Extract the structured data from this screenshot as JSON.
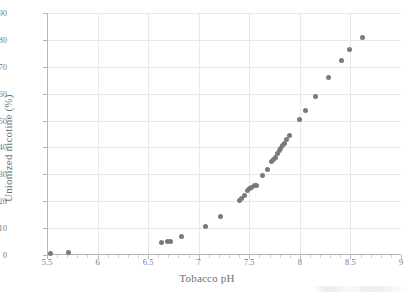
{
  "chart_data": {
    "type": "scatter",
    "title": "",
    "xlabel": "Tobacco pH",
    "ylabel": "Unionized nicotine (%)",
    "xlim": [
      5.5,
      9
    ],
    "ylim": [
      0,
      90
    ],
    "xticks": [
      "5.5",
      "6",
      "6.5",
      "7",
      "7.5",
      "8",
      "8.5",
      "9"
    ],
    "xtick_values": [
      5.5,
      6,
      6.5,
      7,
      7.5,
      8,
      8.5,
      9
    ],
    "yticks": [
      "0",
      "10",
      "20",
      "30",
      "40",
      "50",
      "60",
      "70",
      "80",
      "90"
    ],
    "ytick_values": [
      0,
      10,
      20,
      30,
      40,
      50,
      60,
      70,
      80,
      90
    ],
    "grid": true,
    "legend": false,
    "marker_color": "#7a7a7e",
    "gridline_color": "#e9e9ec",
    "axis_color": "#b6b6bb",
    "series": [
      {
        "name": "Unionized nicotine vs tobacco pH",
        "points": [
          [
            5.53,
            0.5
          ],
          [
            5.71,
            0.8
          ],
          [
            6.63,
            4.6
          ],
          [
            6.69,
            5.0
          ],
          [
            6.72,
            5.2
          ],
          [
            6.83,
            7.0
          ],
          [
            7.07,
            10.7
          ],
          [
            7.22,
            14.2
          ],
          [
            7.4,
            20.3
          ],
          [
            7.42,
            21.0
          ],
          [
            7.45,
            22.0
          ],
          [
            7.48,
            24.0
          ],
          [
            7.5,
            24.6
          ],
          [
            7.52,
            25.1
          ],
          [
            7.55,
            25.9
          ],
          [
            7.57,
            26.0
          ],
          [
            7.63,
            29.5
          ],
          [
            7.68,
            31.8
          ],
          [
            7.72,
            34.9
          ],
          [
            7.74,
            35.6
          ],
          [
            7.76,
            36.3
          ],
          [
            7.78,
            37.6
          ],
          [
            7.8,
            38.9
          ],
          [
            7.81,
            39.6
          ],
          [
            7.83,
            40.8
          ],
          [
            7.85,
            41.6
          ],
          [
            7.87,
            43.0
          ],
          [
            7.9,
            44.6
          ],
          [
            8.0,
            50.5
          ],
          [
            8.06,
            53.9
          ],
          [
            8.15,
            58.8
          ],
          [
            8.28,
            65.9
          ],
          [
            8.41,
            72.4
          ],
          [
            8.49,
            76.5
          ],
          [
            8.62,
            80.9
          ]
        ]
      }
    ]
  }
}
